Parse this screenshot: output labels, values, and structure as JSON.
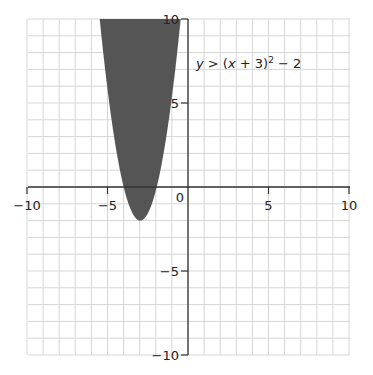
{
  "chart_data": {
    "type": "area",
    "title": "",
    "inequality": "y > (x + 3)² − 2",
    "equation_parts": {
      "lhs": "y",
      "op": ">",
      "expr": "(x + 3)",
      "exp": "2",
      "tail": " − 2"
    },
    "xlabel": "",
    "ylabel": "",
    "xlim": [
      -10,
      10
    ],
    "ylim": [
      -10,
      10
    ],
    "grid": true,
    "grid_step": 1,
    "x_ticks": [
      -10,
      -5,
      0,
      5,
      10
    ],
    "y_ticks": [
      -10,
      -5,
      5,
      10
    ],
    "x_tick_labels": [
      "−10",
      "−5",
      "0",
      "5",
      "10"
    ],
    "y_tick_labels": [
      "−10",
      "−5",
      "5",
      "10"
    ],
    "origin_label": "0",
    "vertex": [
      -3,
      -2
    ],
    "shaded_region": "inside parabola (above curve)",
    "shade_color": "#555555"
  }
}
